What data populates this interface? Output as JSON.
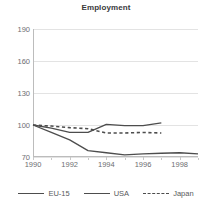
{
  "chart_data": {
    "type": "line",
    "title": "Employment",
    "xlabel": "",
    "ylabel": "",
    "xlim": [
      1990,
      1999
    ],
    "ylim": [
      70,
      190
    ],
    "yticks": [
      70,
      100,
      130,
      160,
      190
    ],
    "xticks": [
      1990,
      1992,
      1994,
      1996,
      1998
    ],
    "grid": true,
    "legend_position": "bottom",
    "series": [
      {
        "name": "EU-15",
        "style": "solid",
        "color": "#4d4d4d",
        "x": [
          1990,
          1991,
          1992,
          1993,
          1994,
          1995,
          1996,
          1997
        ],
        "values": [
          100,
          97,
          93,
          93,
          100.5,
          99.5,
          99.5,
          102
        ]
      },
      {
        "name": "USA",
        "style": "solid",
        "color": "#4d4d4d",
        "x": [
          1990,
          1991,
          1992,
          1993,
          1994,
          1995,
          1996,
          1997,
          1998,
          1999
        ],
        "values": [
          100,
          93,
          86,
          76,
          74,
          72,
          73,
          73.5,
          74,
          73
        ]
      },
      {
        "name": "Japan",
        "style": "dotted",
        "color": "#4d4d4d",
        "x": [
          1990,
          1991,
          1992,
          1993,
          1994,
          1995,
          1996,
          1997
        ],
        "values": [
          100,
          99,
          97.5,
          96.5,
          92.5,
          92.5,
          93,
          92.5
        ]
      }
    ]
  },
  "legend": {
    "items": [
      {
        "label": "EU-15",
        "style": "solid"
      },
      {
        "label": "USA",
        "style": "solid"
      },
      {
        "label": "Japan",
        "style": "dotted"
      }
    ]
  },
  "colors": {
    "line": "#4d4d4d",
    "grid": "#e3e3e3",
    "axis": "#bcbcbc",
    "text": "#6d6e71",
    "title": "#3a3a3c",
    "background": "#ffffff"
  }
}
